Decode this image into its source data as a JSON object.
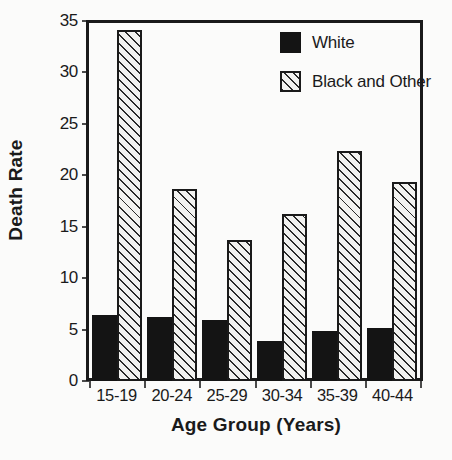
{
  "chart_data": {
    "type": "bar",
    "title": "",
    "xlabel": "Age Group (Years)",
    "ylabel": "Death Rate",
    "categories": [
      "15-19",
      "20-24",
      "25-29",
      "30-34",
      "35-39",
      "40-44"
    ],
    "series": [
      {
        "name": "White",
        "values": [
          6.4,
          6.2,
          5.9,
          3.9,
          4.9,
          5.2
        ],
        "style": "solid-black"
      },
      {
        "name": "Black and Other",
        "values": [
          34.1,
          18.7,
          13.7,
          16.2,
          22.4,
          19.4
        ],
        "style": "diagonal-hatch"
      }
    ],
    "ylim": [
      0,
      35
    ],
    "yticks": [
      0,
      5,
      10,
      15,
      20,
      25,
      30,
      35
    ],
    "ytick_labels": [
      "0",
      "5",
      "10",
      "15",
      "20",
      "25",
      "30",
      "35"
    ],
    "grid": false,
    "legend_position": "top-right",
    "frame": true
  },
  "legend": {
    "items": [
      {
        "label": "White",
        "swatch": "solid-black-square-icon"
      },
      {
        "label": "Black and Other",
        "swatch": "hatched-square-icon"
      }
    ]
  },
  "caption": {
    "text": ""
  }
}
